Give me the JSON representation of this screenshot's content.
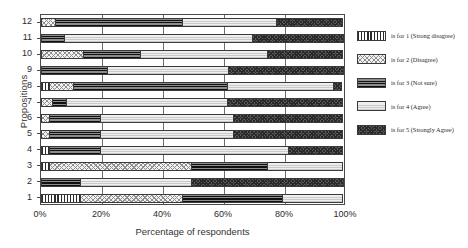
{
  "chart_data": {
    "type": "bar",
    "orientation": "horizontal",
    "stacked": true,
    "normalized_percent": true,
    "title": "",
    "xlabel": "Percentage of respondents",
    "ylabel": "Propositions",
    "xlim": [
      0,
      100
    ],
    "xticks": [
      "0%",
      "20%",
      "40%",
      "60%",
      "80%",
      "100%"
    ],
    "xtick_values": [
      0,
      20,
      40,
      60,
      80,
      100
    ],
    "categories": [
      "1",
      "2",
      "3",
      "4",
      "5",
      "6",
      "7",
      "8",
      "9",
      "10",
      "11",
      "12"
    ],
    "grid": "vertical",
    "legend_position": "right",
    "series": [
      {
        "name": "is for 1 (Strong disagree)",
        "key": "1",
        "pattern": "vertical-lines",
        "values": [
          13,
          0,
          3,
          3,
          0,
          0,
          0,
          3,
          0,
          0,
          0,
          0
        ]
      },
      {
        "name": "is for 2 (Disagree)",
        "key": "2",
        "pattern": "checker",
        "values": [
          34,
          0,
          47,
          0,
          3,
          3,
          4,
          8,
          0,
          14,
          0,
          5
        ]
      },
      {
        "name": "is for 3 (Not sure)",
        "key": "3",
        "pattern": "horizontal-dark-lines",
        "values": [
          33,
          13,
          25,
          17,
          17,
          17,
          5,
          51,
          22,
          19,
          8,
          42
        ]
      },
      {
        "name": "is for 4 (Agree)",
        "key": "4",
        "pattern": "light-fine-lines",
        "values": [
          20,
          37,
          25,
          62,
          44,
          44,
          53,
          35,
          40,
          42,
          62,
          31
        ]
      },
      {
        "name": "is for 5 (Strongly Agree)",
        "key": "5",
        "pattern": "dense-stipple",
        "values": [
          0,
          50,
          0,
          18,
          36,
          36,
          38,
          3,
          38,
          25,
          30,
          22
        ]
      }
    ],
    "rows": [
      {
        "category": "12",
        "segments": [
          0,
          5,
          42,
          31,
          22
        ]
      },
      {
        "category": "11",
        "segments": [
          0,
          0,
          8,
          62,
          30
        ]
      },
      {
        "category": "10",
        "segments": [
          0,
          14,
          19,
          42,
          25
        ]
      },
      {
        "category": "9",
        "segments": [
          0,
          0,
          22,
          40,
          38
        ]
      },
      {
        "category": "8",
        "segments": [
          3,
          8,
          51,
          35,
          3
        ]
      },
      {
        "category": "7",
        "segments": [
          0,
          4,
          5,
          53,
          38
        ]
      },
      {
        "category": "6",
        "segments": [
          0,
          3,
          17,
          44,
          36
        ]
      },
      {
        "category": "5",
        "segments": [
          0,
          3,
          17,
          44,
          36
        ]
      },
      {
        "category": "4",
        "segments": [
          3,
          0,
          17,
          62,
          18
        ]
      },
      {
        "category": "3",
        "segments": [
          3,
          47,
          25,
          25,
          0
        ]
      },
      {
        "category": "2",
        "segments": [
          0,
          0,
          13,
          37,
          50
        ]
      },
      {
        "category": "1",
        "segments": [
          13,
          34,
          33,
          20,
          0
        ]
      }
    ]
  },
  "legend": {
    "items": [
      {
        "label": "is for 1 (Strong disagree)",
        "swatch": "pattern-1-swatch"
      },
      {
        "label": "is for 2 (Disagree)",
        "swatch": "pattern-2-swatch"
      },
      {
        "label": "is for 3 (Not sure)",
        "swatch": "pattern-3-swatch"
      },
      {
        "label": "is for 4 (Agree)",
        "swatch": "pattern-4-swatch"
      },
      {
        "label": "is for 5 (Strongly Agree)",
        "swatch": "pattern-5-swatch"
      }
    ]
  },
  "colors": {
    "pattern_1": "#2b2b2b",
    "pattern_2": "#8f8f8f",
    "pattern_3": "#111111",
    "pattern_4": "#c9c9c9",
    "pattern_5": "#2a2a2a",
    "axis": "#4a4a4a",
    "grid": "#6e6e6e",
    "text": "#2b2b2b",
    "background": "#ffffff"
  }
}
